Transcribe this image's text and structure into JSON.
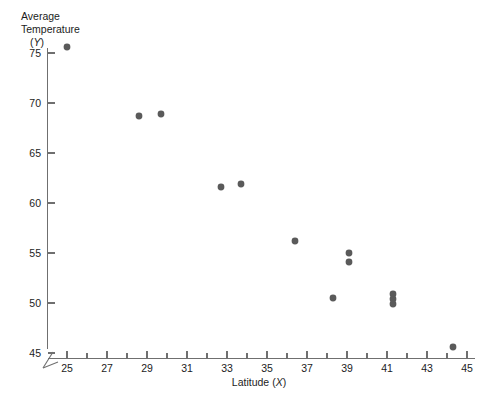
{
  "chart_data": {
    "type": "scatter",
    "title": "",
    "xlabel": "Latitude (X)",
    "ylabel": "Average Temperature (Y)",
    "ylabel_lines": [
      "Average",
      "Temperature",
      "(Y)"
    ],
    "xlabel_prefix": "Latitude (",
    "xlabel_var": "X",
    "xlabel_suffix": ")",
    "ylabel_var": "Y",
    "xlim": [
      24,
      46
    ],
    "ylim": [
      44.5,
      75.5
    ],
    "x_ticks": [
      25,
      27,
      29,
      31,
      33,
      35,
      37,
      39,
      41,
      43,
      45
    ],
    "x_tick_labels": [
      "25",
      "27",
      "29",
      "31",
      "33",
      "35",
      "37",
      "39",
      "41",
      "43",
      "45"
    ],
    "x_minor_ticks": [
      26,
      28,
      30,
      32,
      34,
      36,
      38,
      40,
      42,
      44
    ],
    "y_ticks": [
      45,
      50,
      55,
      60,
      65,
      70,
      75
    ],
    "y_tick_labels": [
      "45",
      "50",
      "55",
      "60",
      "65",
      "70",
      "75"
    ],
    "grid": false,
    "legend": null,
    "axis_break_x": true,
    "axis_break_y": true,
    "marker_color": "#5a5a5a",
    "marker_size": 3.4,
    "points": [
      {
        "x": 25.0,
        "y": 75.6
      },
      {
        "x": 28.6,
        "y": 68.7
      },
      {
        "x": 29.7,
        "y": 68.9
      },
      {
        "x": 32.7,
        "y": 61.6
      },
      {
        "x": 33.7,
        "y": 61.9
      },
      {
        "x": 36.4,
        "y": 56.2
      },
      {
        "x": 39.1,
        "y": 55.0
      },
      {
        "x": 39.1,
        "y": 54.1
      },
      {
        "x": 38.3,
        "y": 50.5
      },
      {
        "x": 41.3,
        "y": 50.9
      },
      {
        "x": 41.3,
        "y": 50.4
      },
      {
        "x": 41.3,
        "y": 49.9
      },
      {
        "x": 44.3,
        "y": 45.6
      }
    ]
  },
  "figure": {
    "width": 487,
    "height": 407,
    "background": "#ffffff"
  }
}
